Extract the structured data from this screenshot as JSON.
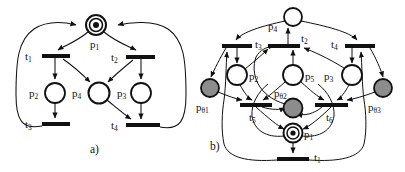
{
  "figure": {
    "width": 405,
    "height": 172,
    "background": "#ffffff",
    "stroke_color": "#111111",
    "shaded_fill": "#8c8c8c",
    "token_fill": "#111111"
  },
  "panels": [
    {
      "id": "a",
      "caption": "a)",
      "caption_pos": {
        "x": 96,
        "y": 152
      },
      "places": [
        {
          "name": "p",
          "subscript": "1",
          "label_x": 96,
          "label_y": 47,
          "cx": 96,
          "cy": 25,
          "r": 10,
          "type": "double",
          "tokens": 1,
          "shaded": false
        },
        {
          "name": "p",
          "subscript": "2",
          "label_x": 34,
          "label_y": 97,
          "cx": 55,
          "cy": 93,
          "r": 10,
          "type": "single",
          "tokens": 0,
          "shaded": false
        },
        {
          "name": "p",
          "subscript": "4",
          "label_x": 78,
          "label_y": 97,
          "cx": 99,
          "cy": 93,
          "r": 10,
          "type": "single",
          "tokens": 0,
          "shaded": false
        },
        {
          "name": "p",
          "subscript": "3",
          "label_x": 120,
          "label_y": 97,
          "cx": 141,
          "cy": 93,
          "r": 10,
          "type": "single",
          "tokens": 0,
          "shaded": false
        }
      ],
      "transitions": [
        {
          "name": "t",
          "subscript": "1",
          "label_x": 28,
          "label_y": 60,
          "x": 42,
          "y": 54,
          "w": 28,
          "h": 4
        },
        {
          "name": "t",
          "subscript": "2",
          "label_x": 114,
          "label_y": 60,
          "x": 126,
          "y": 55,
          "w": 29,
          "h": 4
        },
        {
          "name": "t",
          "subscript": "3",
          "label_x": 28,
          "label_y": 128,
          "x": 42,
          "y": 122,
          "w": 28,
          "h": 4
        },
        {
          "name": "t",
          "subscript": "4",
          "label_x": 114,
          "label_y": 129,
          "x": 126,
          "y": 123,
          "w": 34,
          "h": 4
        }
      ]
    },
    {
      "id": "b",
      "caption": "b)",
      "caption_pos": {
        "x": 215,
        "y": 150
      },
      "places": [
        {
          "name": "p",
          "subscript": "4",
          "label_x": 272,
          "label_y": 29,
          "cx": 293,
          "cy": 17,
          "r": 9,
          "type": "single",
          "tokens": 0,
          "shaded": false
        },
        {
          "name": "p",
          "subscript": "2",
          "label_x": 251,
          "label_y": 80,
          "cx": 237,
          "cy": 75,
          "r": 10,
          "type": "single",
          "tokens": 0,
          "shaded": false
        },
        {
          "name": "p",
          "subscript": "5",
          "label_x": 307,
          "label_y": 80,
          "cx": 293,
          "cy": 75,
          "r": 10,
          "type": "single",
          "tokens": 0,
          "shaded": false
        },
        {
          "name": "p",
          "subscript": "3",
          "label_x": 326,
          "label_y": 80,
          "cx": 352,
          "cy": 75,
          "r": 10,
          "type": "single",
          "tokens": 0,
          "shaded": false
        },
        {
          "name": "p",
          "subscript": "θ1",
          "label_x": 199,
          "label_y": 110,
          "cx": 210,
          "cy": 88,
          "r": 9,
          "type": "single",
          "tokens": 0,
          "shaded": true
        },
        {
          "name": "p",
          "subscript": "θ2",
          "label_x": 279,
          "label_y": 96,
          "cx": 293,
          "cy": 108,
          "r": 9,
          "type": "single",
          "tokens": 0,
          "shaded": true
        },
        {
          "name": "p",
          "subscript": "θ3",
          "label_x": 372,
          "label_y": 110,
          "cx": 383,
          "cy": 88,
          "r": 9,
          "type": "single",
          "tokens": 0,
          "shaded": true
        },
        {
          "name": "p",
          "subscript": "1",
          "label_x": 307,
          "label_y": 138,
          "cx": 293,
          "cy": 133,
          "r": 9,
          "type": "double",
          "tokens": 1,
          "shaded": false
        }
      ],
      "transitions": [
        {
          "name": "t",
          "subscript": "3",
          "label_x": 256,
          "label_y": 47,
          "x": 222,
          "y": 44,
          "w": 30,
          "h": 4
        },
        {
          "name": "t",
          "subscript": "2",
          "label_x": 305,
          "label_y": 43,
          "x": 268,
          "y": 44,
          "w": 32,
          "h": 4
        },
        {
          "name": "t",
          "subscript": "4",
          "label_x": 333,
          "label_y": 47,
          "x": 345,
          "y": 44,
          "w": 30,
          "h": 4
        },
        {
          "name": "t",
          "subscript": "5",
          "label_x": 253,
          "label_y": 121,
          "x": 240,
          "y": 103,
          "w": 32,
          "h": 4
        },
        {
          "name": "t",
          "subscript": "6",
          "label_x": 329,
          "label_y": 121,
          "x": 315,
          "y": 103,
          "w": 33,
          "h": 4
        },
        {
          "name": "t",
          "subscript": "1",
          "label_x": 308,
          "label_y": 163,
          "x": 277,
          "y": 157,
          "w": 32,
          "h": 4
        }
      ]
    }
  ]
}
